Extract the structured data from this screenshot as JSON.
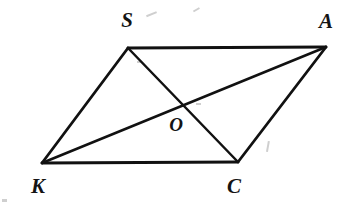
{
  "figure": {
    "kind": "geometry-diagram",
    "shape_name": "parallelogram",
    "background_color": "#ffffff",
    "ink_color": "#111111",
    "canvas": {
      "width": 357,
      "height": 208
    },
    "stroke_width_edge": 2.6,
    "stroke_width_diagonal": 2.4,
    "label_font_size": 21,
    "point_label_font_size": 19
  },
  "vertices": [
    {
      "id": "S",
      "label": "S",
      "x": 128,
      "y": 48,
      "label_x": 127,
      "label_y": 22
    },
    {
      "id": "A",
      "label": "A",
      "x": 326,
      "y": 47,
      "label_x": 326,
      "label_y": 23
    },
    {
      "id": "C",
      "label": "C",
      "x": 238,
      "y": 162,
      "label_x": 234,
      "label_y": 188
    },
    {
      "id": "K",
      "label": "K",
      "x": 42,
      "y": 163,
      "label_x": 38,
      "label_y": 188
    }
  ],
  "intersection": {
    "id": "O",
    "label": "O",
    "x": 181,
    "y": 110,
    "label_x": 176,
    "label_y": 127
  },
  "edges": [
    {
      "id": "SA",
      "from": "S",
      "to": "A",
      "x1": 128,
      "y1": 48,
      "x2": 326,
      "y2": 47
    },
    {
      "id": "AC",
      "from": "A",
      "to": "C",
      "x1": 326,
      "y1": 47,
      "x2": 238,
      "y2": 162
    },
    {
      "id": "CK",
      "from": "C",
      "to": "K",
      "x1": 238,
      "y1": 162,
      "x2": 42,
      "y2": 163
    },
    {
      "id": "KS",
      "from": "K",
      "to": "S",
      "x1": 42,
      "y1": 163,
      "x2": 128,
      "y2": 48
    }
  ],
  "diagonals": [
    {
      "id": "SC",
      "from": "S",
      "to": "C",
      "x1": 128,
      "y1": 48,
      "x2": 238,
      "y2": 162
    },
    {
      "id": "KA",
      "from": "K",
      "to": "A",
      "x1": 42,
      "y1": 163,
      "x2": 326,
      "y2": 47
    }
  ],
  "artifacts": [
    {
      "id": "speck-top-center",
      "x": 152,
      "y": 14,
      "w": 11,
      "h": 2,
      "rot": -22
    },
    {
      "id": "speck-top-right",
      "x": 196,
      "y": 10,
      "w": 7,
      "h": 2,
      "rot": -30
    },
    {
      "id": "speck-mid-right",
      "x": 268,
      "y": 146,
      "w": 2,
      "h": 11,
      "rot": 10
    },
    {
      "id": "speck-upper-left",
      "x": 139,
      "y": 62,
      "w": 4,
      "h": 2,
      "rot": 0
    },
    {
      "id": "speck-center",
      "x": 198,
      "y": 104,
      "w": 5,
      "h": 2,
      "rot": 0
    }
  ]
}
